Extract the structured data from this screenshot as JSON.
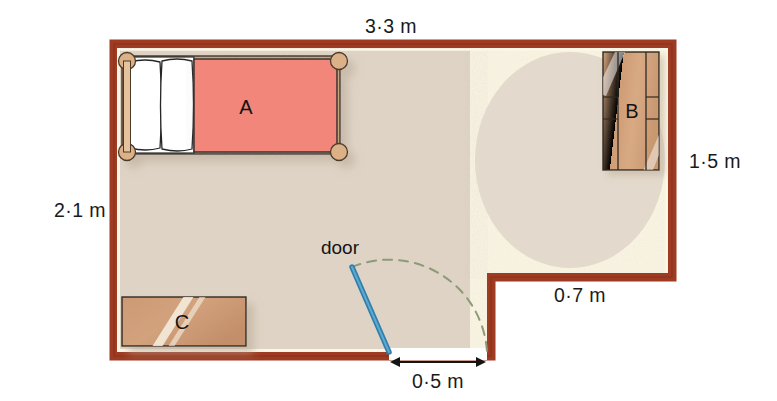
{
  "diagram": {
    "unit": "m"
  },
  "dimensions": {
    "top_width": "3·3 m",
    "left_height": "2·1 m",
    "right_height": "1·5 m",
    "bottom_right": "0·7 m",
    "door_width": "0·5 m"
  },
  "furniture": {
    "bed": {
      "label": "A",
      "name": "bed",
      "color": "#F2867A"
    },
    "wardrobe": {
      "label": "B",
      "name": "wardrobe",
      "color": "#D1A07C"
    },
    "chest": {
      "label": "C",
      "name": "chest-of-drawers",
      "color": "#C99975"
    }
  },
  "door": {
    "label": "door",
    "leaf_color": "#2E7FAE",
    "arc_color": "#8f9a78"
  },
  "colors": {
    "wall": "#9E3B22",
    "wall_dark": "#8E3218",
    "inner_trim": "#FAF3DF",
    "carpet": "#DED3C5",
    "floor_cream": "#FAF4E2",
    "rug": "#E2D8CB",
    "bed_fill": "#F2867A",
    "bed_post": "#D9B089",
    "linen": "#FFFFFF",
    "text": "#141414"
  }
}
